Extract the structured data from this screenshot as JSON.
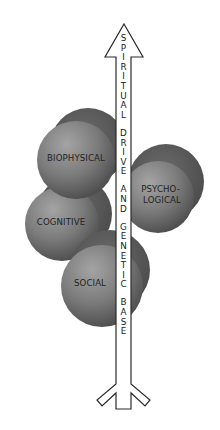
{
  "diagram": {
    "spheres": [
      {
        "id": "biophysical",
        "lines": [
          "BIOPHYSICAL"
        ]
      },
      {
        "id": "psychological",
        "lines": [
          "PSYCHO-",
          "LOGICAL"
        ]
      },
      {
        "id": "cognitive",
        "lines": [
          "COGNITIVE"
        ]
      },
      {
        "id": "social",
        "lines": [
          "SOCIAL"
        ]
      }
    ],
    "arrow": {
      "words": [
        "SPIRITUAL",
        "DRIVE",
        "AND",
        "GENETIC",
        "BASE"
      ],
      "full_text": "SPIRITUAL DRIVE AND GENETIC BASE"
    },
    "colors": {
      "sphere_back": "#555555",
      "sphere_front_light": "#9a9a9a",
      "sphere_front_dark": "#4e4e4e",
      "arrow_fill": "#ffffff",
      "arrow_stroke": "#2a2a2a",
      "text": "#1f1f1f"
    }
  }
}
